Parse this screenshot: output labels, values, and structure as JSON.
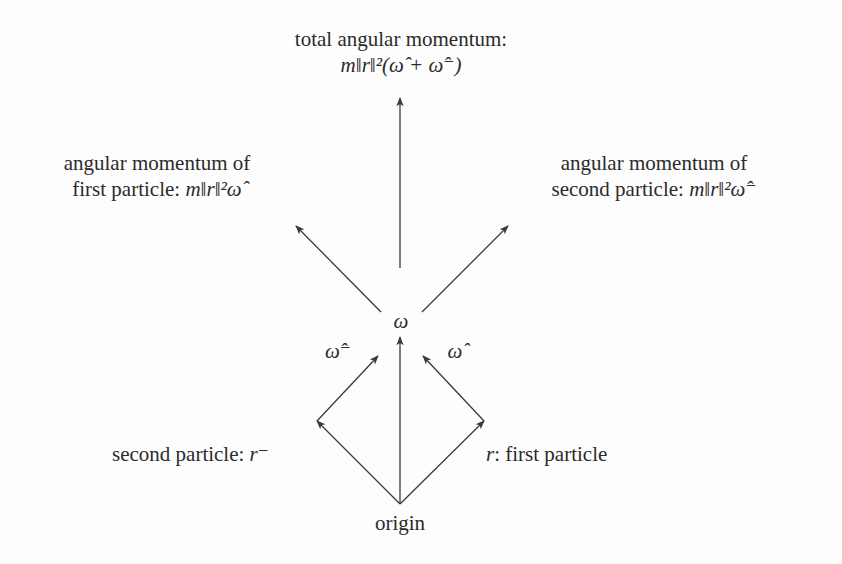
{
  "diagram": {
    "nodes": {
      "total": {
        "line1": "total angular momentum:",
        "formula": "m‖r‖²(ω̂ + ω̂⁻)"
      },
      "first_am": {
        "line1": "angular momentum of",
        "line2_text": "first particle: ",
        "formula": "m‖r‖²ω̂"
      },
      "second_am": {
        "line1": "angular momentum of",
        "line2_text": "second particle: ",
        "formula": "m‖r‖²ω̂⁻"
      },
      "omega": "ω",
      "omega_hat_minus": "ω̂⁻",
      "omega_hat": "ω̂",
      "second_particle": {
        "text": "second particle: ",
        "symbol": "r⁻"
      },
      "first_particle": {
        "symbol": "r",
        "text": ": first particle"
      },
      "origin": "origin"
    },
    "edges": [
      {
        "from": "origin",
        "to": "first_particle",
        "label": "r"
      },
      {
        "from": "origin",
        "to": "second_particle",
        "label": "r⁻"
      },
      {
        "from": "origin",
        "to": "omega",
        "label": ""
      },
      {
        "from": "first_particle",
        "to": "omega_hat",
        "label": ""
      },
      {
        "from": "second_particle",
        "to": "omega_hat_minus",
        "label": ""
      },
      {
        "from": "omega",
        "to": "total",
        "label": ""
      },
      {
        "from": "omega",
        "to": "first_am",
        "label": ""
      },
      {
        "from": "omega",
        "to": "second_am",
        "label": ""
      }
    ],
    "colors": {
      "line": "#3a3a3a",
      "text": "#2b2b2b",
      "background": "#fdfdfd"
    }
  }
}
